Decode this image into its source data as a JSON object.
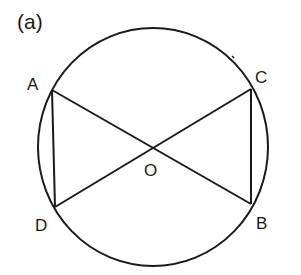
{
  "figure": {
    "label": "(a)",
    "stroke_color": "#1a1a1a",
    "background": "#ffffff"
  },
  "circle": {
    "center": {
      "x": 153,
      "y": 147
    },
    "rx": 115,
    "ry": 119
  },
  "points": {
    "A": {
      "label": "A",
      "x": 52,
      "y": 90,
      "label_x": 27,
      "label_y": 90
    },
    "B": {
      "label": "B",
      "x": 251,
      "y": 204,
      "label_x": 256,
      "label_y": 229
    },
    "C": {
      "label": "C",
      "x": 251,
      "y": 89,
      "label_x": 255,
      "label_y": 83
    },
    "D": {
      "label": "D",
      "x": 55,
      "y": 207,
      "label_x": 35,
      "label_y": 231
    },
    "O": {
      "label": "O",
      "x": 152,
      "y": 148,
      "label_x": 144,
      "label_y": 176
    }
  },
  "segments": [
    {
      "from": "A",
      "to": "B"
    },
    {
      "from": "C",
      "to": "D"
    },
    {
      "from": "A",
      "to": "D"
    },
    {
      "from": "C",
      "to": "B"
    }
  ],
  "mark": {
    "x1": 232,
    "y1": 56,
    "x2": 234,
    "y2": 58
  }
}
